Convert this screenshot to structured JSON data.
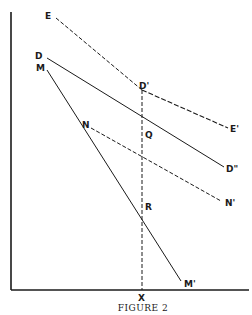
{
  "figure": {
    "caption": "Figure 2",
    "caption_display": "FIGURE 2",
    "ink_color": "#1a1a1a",
    "background": "#ffffff"
  },
  "labels": {
    "E": "E",
    "D": "D",
    "M": "M",
    "N": "N",
    "D_prime": "D'",
    "E_prime": "E'",
    "D_double_prime": "D\"",
    "N_prime": "N'",
    "M_prime": "M'",
    "Q": "Q",
    "R": "R",
    "X": "X"
  },
  "lines": [
    {
      "name": "EE'",
      "style": "dashed",
      "from": "E",
      "through": "D'",
      "to": "E'"
    },
    {
      "name": "DD''",
      "style": "solid",
      "from": "D",
      "through": "D'",
      "to": "D\""
    },
    {
      "name": "MM'",
      "style": "solid",
      "from": "M",
      "through": "Q, R",
      "to": "M'"
    },
    {
      "name": "NN'",
      "style": "dashed",
      "from": "N",
      "through": "Q",
      "to": "N'"
    },
    {
      "name": "D'X",
      "style": "dashed",
      "from": "D'",
      "through": "Q, R",
      "to": "X"
    }
  ]
}
